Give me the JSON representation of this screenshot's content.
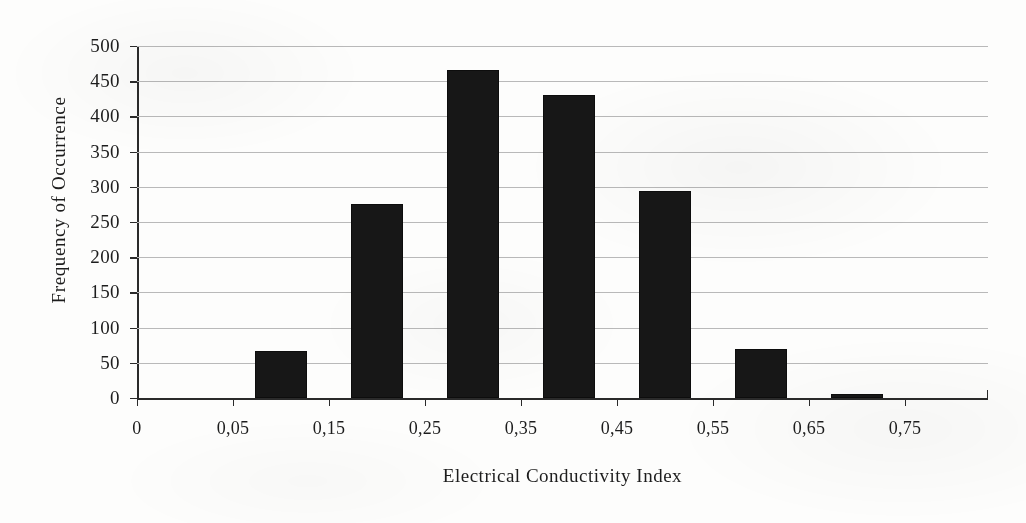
{
  "chart_data": {
    "type": "bar",
    "title": "",
    "xlabel": "Electrical Conductivity Index",
    "ylabel": "Frequency of Occurrence",
    "categories": [
      "0,05",
      "0,15",
      "0,25",
      "0,35",
      "0,45",
      "0,55",
      "0,65"
    ],
    "values": [
      67,
      276,
      466,
      431,
      294,
      69,
      6
    ],
    "xtick_labels": [
      "0",
      "0,05",
      "0,15",
      "0,25",
      "0,35",
      "0,45",
      "0,55",
      "0,65",
      "0,75"
    ],
    "ytick_labels": [
      "0",
      "50",
      "100",
      "150",
      "200",
      "250",
      "300",
      "350",
      "400",
      "450",
      "500"
    ],
    "ytick_values": [
      0,
      50,
      100,
      150,
      200,
      250,
      300,
      350,
      400,
      450,
      500
    ],
    "ylim": [
      0,
      500
    ],
    "grid": "horizontal",
    "legend": "none",
    "bar_color": "#171717",
    "gridline_color": "#b9b9b9",
    "axis_color": "#2a2a2a",
    "background": "#fdfdfc"
  }
}
